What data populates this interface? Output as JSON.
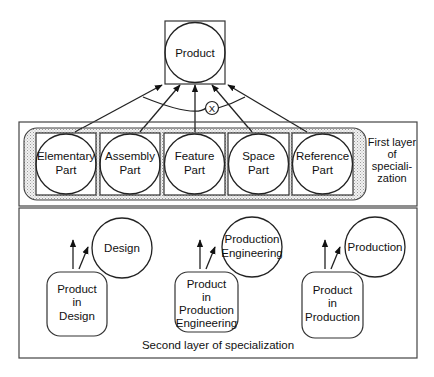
{
  "diagram": {
    "root": {
      "label": "Product"
    },
    "operator": {
      "symbol": "X"
    },
    "first_layer": {
      "caption": [
        "First layer",
        "of",
        "speciali-",
        "zation"
      ],
      "parts": [
        {
          "lines": [
            "Elementary",
            "Part"
          ]
        },
        {
          "lines": [
            "Assembly",
            "Part"
          ]
        },
        {
          "lines": [
            "Feature",
            "Part"
          ]
        },
        {
          "lines": [
            "Space",
            "Part"
          ]
        },
        {
          "lines": [
            "Reference",
            "Part"
          ]
        }
      ]
    },
    "second_layer": {
      "caption": "Second layer of specialization",
      "groups": [
        {
          "view": [
            "Design"
          ],
          "product": [
            "Product",
            "in",
            "Design"
          ]
        },
        {
          "view": [
            "Production",
            "Engineering"
          ],
          "product": [
            "Product",
            "in",
            "Production",
            "Engineering"
          ]
        },
        {
          "view": [
            "Production"
          ],
          "product": [
            "Product",
            "in",
            "Production"
          ]
        }
      ]
    }
  }
}
